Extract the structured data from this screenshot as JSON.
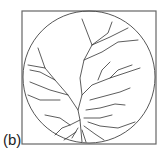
{
  "figure": {
    "panel_label": "(b)",
    "colors": {
      "stroke": "#333333",
      "background": "#ffffff"
    }
  }
}
